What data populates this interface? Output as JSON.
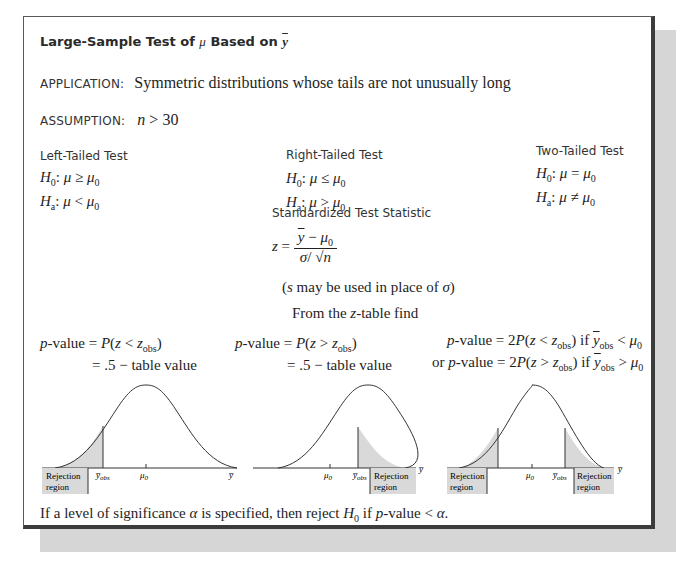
{
  "application": {
    "label": "APPLICATION:",
    "text": "Symmetric distributions whose tails are not unusually long"
  },
  "assumption": {
    "label": "ASSUMPTION:",
    "text": "n > 30"
  },
  "tests": [
    {
      "name": "Left-Tailed Test",
      "h0": "H₀: μ ≥ μ₀",
      "ha": "Hₐ: μ < μ₀",
      "pvalue_line1": "p-value = P(z < zₒᵦₛ)",
      "pvalue_line2": "= .5 − table value"
    },
    {
      "name": "Right-Tailed Test",
      "h0": "H₀: μ ≤ μ₀",
      "ha": "Hₐ: μ > μ₀",
      "pvalue_line1": "p-value = P(z > zₒᵦₛ)",
      "pvalue_line2": "= .5 − table value"
    },
    {
      "name": "Two-Tailed Test",
      "h0": "H₀: μ = μ₀",
      "ha": "Hₐ: μ ≠ μ₀",
      "pvalue_line1": "p-value = 2P(z < zₒᵦₛ) if y̅ₒᵦₛ < μ₀",
      "pvalue_line2": "or p-value = 2P(z > zₒᵦₛ) if y̅ₒᵦₛ > μ₀"
    }
  ],
  "statistic": {
    "heading": "Standardized Test Statistic",
    "lhs": "z =",
    "numerator": "y̅ − μ₀",
    "denominator": "σ/√n",
    "note": "(s may be used in place of σ)",
    "table_hint": "From the z-table find"
  },
  "plots": {
    "rejection_label_1": "Rejection",
    "rejection_label_2": "region",
    "axis_label": "y̅",
    "mean_label": "μ₀",
    "obs_label": "y̅obs",
    "shade_color": "#d9d9d9"
  },
  "conclusion": "If a level of significance α is specified, then reject H₀ if p-value < α."
}
